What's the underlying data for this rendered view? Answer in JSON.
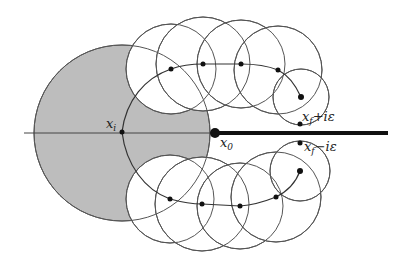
{
  "diagram": {
    "colors": {
      "background": "#ffffff",
      "shaded_region": "#bdbdbd",
      "circle_stroke": "#555555",
      "branch_cut": "#111111",
      "points": "#111111"
    },
    "labels": {
      "x_i": {
        "base": "x",
        "sub": "i",
        "tail": ""
      },
      "x_0": {
        "base": "x",
        "sub": "0",
        "tail": ""
      },
      "x_f_plus": {
        "base": "x",
        "sub": "f",
        "tail": "+iε"
      },
      "x_f_minus": {
        "base": "x",
        "sub": "f",
        "tail": "−iε"
      }
    },
    "shaded_disk": {
      "cx": 122,
      "cy": 133,
      "r": 88
    },
    "axis": {
      "x1": 24,
      "x2": 213,
      "y": 133
    },
    "branch_cut": {
      "x1": 213,
      "x2": 388,
      "y": 133,
      "width": 4
    },
    "branch_point": {
      "cx": 215,
      "cy": 133,
      "r": 5
    },
    "start_point": {
      "cx": 122,
      "cy": 132
    },
    "upper_path": {
      "points": [
        [
          171,
          69
        ],
        [
          203,
          64
        ],
        [
          241,
          64
        ],
        [
          278,
          70
        ],
        [
          301,
          97
        ]
      ],
      "circles": [
        {
          "cx": 171,
          "cy": 69,
          "r": 45
        },
        {
          "cx": 203,
          "cy": 64,
          "r": 47
        },
        {
          "cx": 241,
          "cy": 64,
          "r": 44
        },
        {
          "cx": 278,
          "cy": 70,
          "r": 44
        },
        {
          "cx": 301,
          "cy": 97,
          "r": 28
        }
      ],
      "end_point": [
        300,
        124
      ]
    },
    "lower_path": {
      "points": [
        [
          170,
          199
        ],
        [
          202,
          204
        ],
        [
          240,
          206
        ],
        [
          276,
          197
        ],
        [
          300,
          171
        ]
      ],
      "circles": [
        {
          "cx": 170,
          "cy": 199,
          "r": 44
        },
        {
          "cx": 202,
          "cy": 204,
          "r": 47
        },
        {
          "cx": 240,
          "cy": 206,
          "r": 43
        },
        {
          "cx": 276,
          "cy": 197,
          "r": 45
        },
        {
          "cx": 300,
          "cy": 171,
          "r": 30
        }
      ],
      "end_point": [
        300,
        143
      ]
    }
  }
}
